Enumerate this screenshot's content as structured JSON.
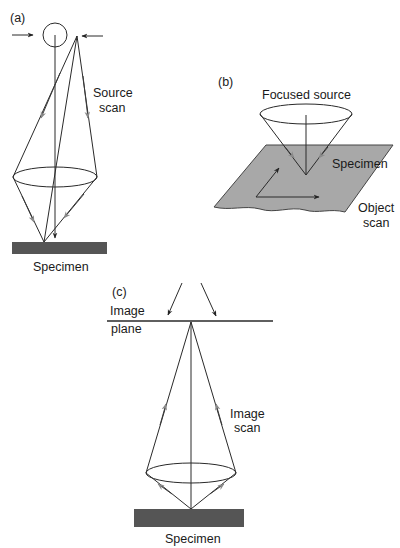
{
  "diagram": {
    "panels": [
      {
        "id": "a",
        "label": "(a)",
        "texts": {
          "source_scan_line1": "Source",
          "source_scan_line2": "scan",
          "specimen": "Specimen"
        }
      },
      {
        "id": "b",
        "label": "(b)",
        "texts": {
          "focused_source": "Focused source",
          "specimen": "Specimen",
          "object_scan_line1": "Object",
          "object_scan_line2": "scan"
        }
      },
      {
        "id": "c",
        "label": "(c)",
        "texts": {
          "image_plane_line1": "Image",
          "image_plane_line2": "plane",
          "image_scan_line1": "Image",
          "image_scan_line2": "scan",
          "specimen": "Specimen"
        }
      }
    ],
    "colors": {
      "line": "#2a2a2a",
      "arrow_gray": "#8a8a8a",
      "specimen_dark": "#555555",
      "specimen_plane": "#a8a8a8"
    }
  }
}
